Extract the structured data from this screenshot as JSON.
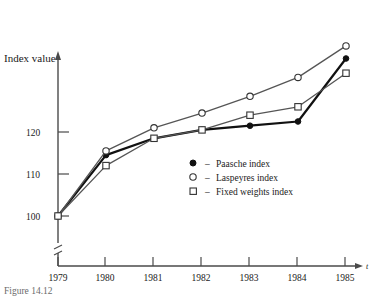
{
  "figure": {
    "caption": "Figure 14.12",
    "y_axis_title": "Index value",
    "x_axis_symbol": "t"
  },
  "chart_data": {
    "type": "line",
    "title": "",
    "subtitle": "",
    "xlabel": "",
    "ylabel": "Index value",
    "x": [
      "1979",
      "1980",
      "1981",
      "1982",
      "1983",
      "1984",
      "1985"
    ],
    "categories": [
      "1979",
      "1980",
      "1981",
      "1982",
      "1983",
      "1984",
      "1985"
    ],
    "series": [
      {
        "name": "Paasche index",
        "marker": "filled-circle",
        "color": "#111111",
        "values": [
          100,
          114.5,
          118.5,
          120.5,
          121.5,
          122.5,
          137.5
        ]
      },
      {
        "name": "Laspeyres index",
        "marker": "open-circle",
        "color": "#555555",
        "values": [
          100,
          115.5,
          121,
          124.5,
          128.5,
          133,
          140.5
        ]
      },
      {
        "name": "Fixed weights index",
        "marker": "open-square",
        "color": "#555555",
        "values": [
          100,
          112,
          118.5,
          120.5,
          124,
          126,
          134
        ]
      }
    ],
    "ytick_labels": [
      "100",
      "110",
      "120"
    ],
    "ytick_values": [
      100,
      110,
      120
    ],
    "xtick_labels": [
      "1979",
      "1980",
      "1981",
      "1982",
      "1983",
      "1984",
      "1985"
    ],
    "ylim": [
      100,
      142
    ],
    "xlim": [
      "1979",
      "1985"
    ],
    "y_axis_break": true,
    "grid": false,
    "legend_position": "inside-center"
  },
  "legend": {
    "entries": [
      {
        "marker": "filled-circle",
        "dash": "–",
        "label": "Paasche index"
      },
      {
        "marker": "open-circle",
        "dash": "–",
        "label": "Laspeyres index"
      },
      {
        "marker": "open-square",
        "dash": "–",
        "label": "Fixed weights index"
      }
    ]
  },
  "colors": {
    "paasche": "#111111",
    "laspeyres": "#555555",
    "fixed_weights": "#555555",
    "axis": "#4a4a4a",
    "text": "#1a1a1a"
  }
}
